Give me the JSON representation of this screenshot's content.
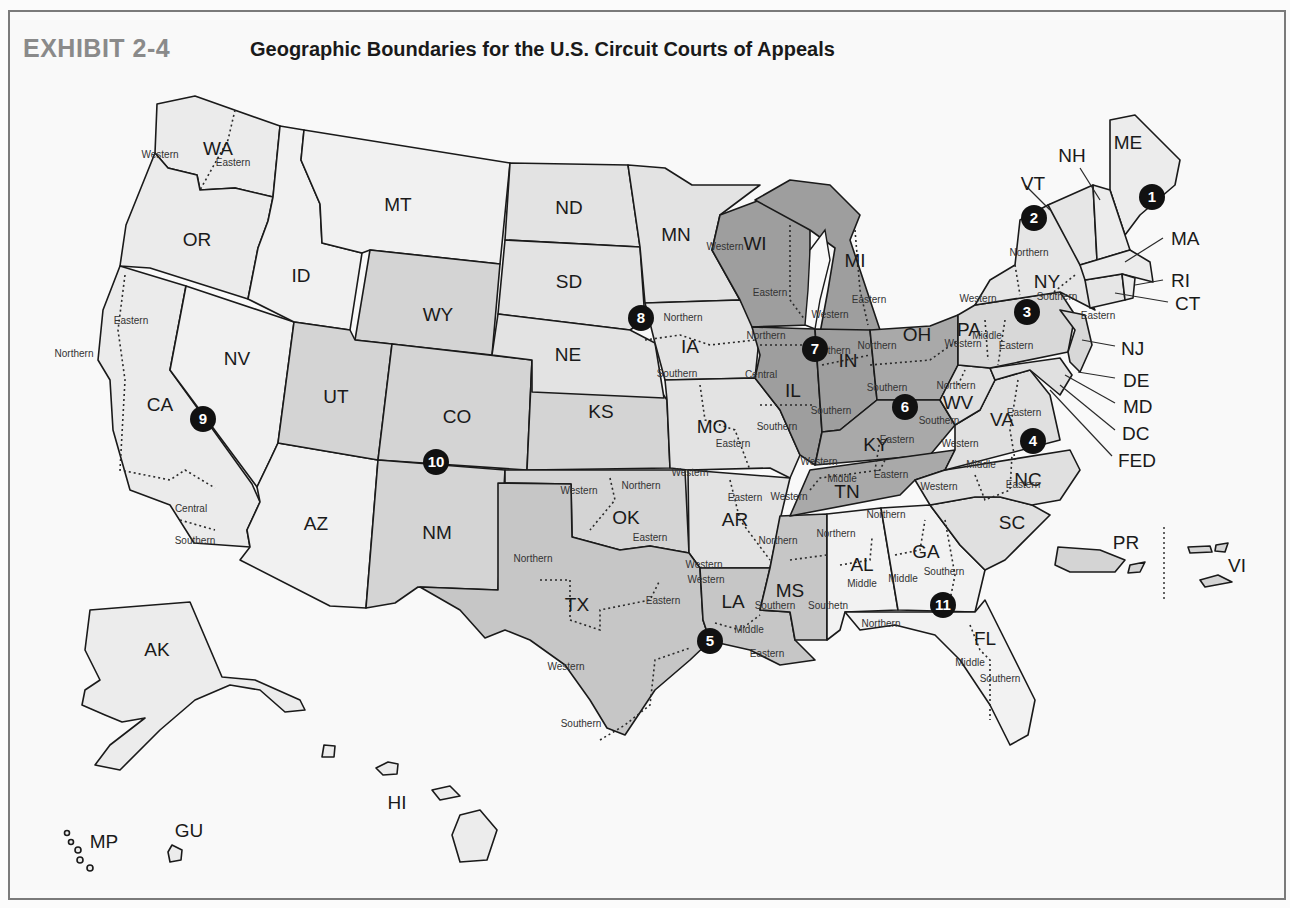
{
  "header": {
    "exhibit_label": "EXHIBIT 2-4",
    "title": "Geographic Boundaries for the U.S. Circuit Courts of Appeals"
  },
  "colors": {
    "light": "#e9e9e9",
    "medium": "#cfcfcf",
    "dark": "#9a9a9a",
    "white_region": "#f3f3f3",
    "marker": "#111111"
  },
  "states": [
    {
      "abbr": "WA",
      "x": 218,
      "y": 150
    },
    {
      "abbr": "OR",
      "x": 197,
      "y": 241
    },
    {
      "abbr": "CA",
      "x": 160,
      "y": 406
    },
    {
      "abbr": "NV",
      "x": 237,
      "y": 360
    },
    {
      "abbr": "ID",
      "x": 301,
      "y": 277
    },
    {
      "abbr": "MT",
      "x": 398,
      "y": 206
    },
    {
      "abbr": "WY",
      "x": 438,
      "y": 316
    },
    {
      "abbr": "UT",
      "x": 336,
      "y": 398
    },
    {
      "abbr": "CO",
      "x": 457,
      "y": 418
    },
    {
      "abbr": "AZ",
      "x": 316,
      "y": 525
    },
    {
      "abbr": "NM",
      "x": 437,
      "y": 534
    },
    {
      "abbr": "ND",
      "x": 569,
      "y": 209
    },
    {
      "abbr": "SD",
      "x": 569,
      "y": 283
    },
    {
      "abbr": "NE",
      "x": 568,
      "y": 356
    },
    {
      "abbr": "KS",
      "x": 601,
      "y": 413
    },
    {
      "abbr": "OK",
      "x": 626,
      "y": 519
    },
    {
      "abbr": "TX",
      "x": 577,
      "y": 606
    },
    {
      "abbr": "MN",
      "x": 676,
      "y": 236
    },
    {
      "abbr": "IA",
      "x": 690,
      "y": 348
    },
    {
      "abbr": "MO",
      "x": 712,
      "y": 428
    },
    {
      "abbr": "AR",
      "x": 735,
      "y": 521
    },
    {
      "abbr": "LA",
      "x": 733,
      "y": 603
    },
    {
      "abbr": "WI",
      "x": 755,
      "y": 245
    },
    {
      "abbr": "IL",
      "x": 793,
      "y": 392
    },
    {
      "abbr": "MI",
      "x": 855,
      "y": 262
    },
    {
      "abbr": "IN",
      "x": 848,
      "y": 362
    },
    {
      "abbr": "OH",
      "x": 917,
      "y": 336
    },
    {
      "abbr": "KY",
      "x": 876,
      "y": 446
    },
    {
      "abbr": "TN",
      "x": 847,
      "y": 493
    },
    {
      "abbr": "MS",
      "x": 790,
      "y": 592
    },
    {
      "abbr": "AL",
      "x": 862,
      "y": 566
    },
    {
      "abbr": "GA",
      "x": 926,
      "y": 553
    },
    {
      "abbr": "FL",
      "x": 985,
      "y": 640
    },
    {
      "abbr": "SC",
      "x": 1012,
      "y": 524
    },
    {
      "abbr": "NC",
      "x": 1028,
      "y": 481
    },
    {
      "abbr": "VA",
      "x": 1002,
      "y": 421
    },
    {
      "abbr": "WV",
      "x": 958,
      "y": 404
    },
    {
      "abbr": "PA",
      "x": 969,
      "y": 331
    },
    {
      "abbr": "NY",
      "x": 1047,
      "y": 283
    },
    {
      "abbr": "VT",
      "x": 1033,
      "y": 185
    },
    {
      "abbr": "NH",
      "x": 1072,
      "y": 157
    },
    {
      "abbr": "ME",
      "x": 1128,
      "y": 144
    },
    {
      "abbr": "AK",
      "x": 157,
      "y": 651
    },
    {
      "abbr": "HI",
      "x": 397,
      "y": 804
    },
    {
      "abbr": "GU",
      "x": 189,
      "y": 832
    },
    {
      "abbr": "MP",
      "x": 104,
      "y": 843
    },
    {
      "abbr": "PR",
      "x": 1126,
      "y": 544
    },
    {
      "abbr": "VI",
      "x": 1237,
      "y": 567
    }
  ],
  "callouts": [
    {
      "abbr": "MA",
      "x": 1171,
      "y": 240
    },
    {
      "abbr": "RI",
      "x": 1171,
      "y": 282
    },
    {
      "abbr": "CT",
      "x": 1175,
      "y": 305
    },
    {
      "abbr": "NJ",
      "x": 1121,
      "y": 350
    },
    {
      "abbr": "DE",
      "x": 1123,
      "y": 382
    },
    {
      "abbr": "MD",
      "x": 1123,
      "y": 408
    },
    {
      "abbr": "DC",
      "x": 1122,
      "y": 435
    },
    {
      "abbr": "FED",
      "x": 1118,
      "y": 462
    }
  ],
  "districts": [
    {
      "text": "Western",
      "x": 160,
      "y": 155
    },
    {
      "text": "Eastern",
      "x": 233,
      "y": 163
    },
    {
      "text": "Eastern",
      "x": 131,
      "y": 321
    },
    {
      "text": "Northern",
      "x": 74,
      "y": 354
    },
    {
      "text": "Central",
      "x": 191,
      "y": 509
    },
    {
      "text": "Southern",
      "x": 195,
      "y": 541
    },
    {
      "text": "Northern",
      "x": 683,
      "y": 318
    },
    {
      "text": "Southern",
      "x": 677,
      "y": 374
    },
    {
      "text": "Eastern",
      "x": 733,
      "y": 444
    },
    {
      "text": "Western",
      "x": 690,
      "y": 473
    },
    {
      "text": "Western",
      "x": 579,
      "y": 491
    },
    {
      "text": "Northern",
      "x": 641,
      "y": 486
    },
    {
      "text": "Eastern",
      "x": 650,
      "y": 538
    },
    {
      "text": "Eastern",
      "x": 745,
      "y": 498
    },
    {
      "text": "Western",
      "x": 704,
      "y": 565
    },
    {
      "text": "Northern",
      "x": 533,
      "y": 559
    },
    {
      "text": "Eastern",
      "x": 663,
      "y": 601
    },
    {
      "text": "Western",
      "x": 566,
      "y": 667
    },
    {
      "text": "Southern",
      "x": 581,
      "y": 724
    },
    {
      "text": "Western",
      "x": 706,
      "y": 580
    },
    {
      "text": "Middle",
      "x": 749,
      "y": 630
    },
    {
      "text": "Eastern",
      "x": 767,
      "y": 654
    },
    {
      "text": "Western",
      "x": 725,
      "y": 247
    },
    {
      "text": "Eastern",
      "x": 770,
      "y": 293
    },
    {
      "text": "Northern",
      "x": 766,
      "y": 336
    },
    {
      "text": "Central",
      "x": 761,
      "y": 375
    },
    {
      "text": "Southern",
      "x": 777,
      "y": 427
    },
    {
      "text": "Western",
      "x": 830,
      "y": 315
    },
    {
      "text": "Eastern",
      "x": 869,
      "y": 300
    },
    {
      "text": "Northern",
      "x": 831,
      "y": 351
    },
    {
      "text": "Southern",
      "x": 831,
      "y": 411
    },
    {
      "text": "Northern",
      "x": 877,
      "y": 346
    },
    {
      "text": "Southern",
      "x": 887,
      "y": 388
    },
    {
      "text": "Eastern",
      "x": 897,
      "y": 440
    },
    {
      "text": "Western",
      "x": 819,
      "y": 462
    },
    {
      "text": "Middle",
      "x": 842,
      "y": 479
    },
    {
      "text": "Eastern",
      "x": 891,
      "y": 475
    },
    {
      "text": "Western",
      "x": 789,
      "y": 497
    },
    {
      "text": "Northern",
      "x": 778,
      "y": 541
    },
    {
      "text": "Southern",
      "x": 775,
      "y": 606
    },
    {
      "text": "Northern",
      "x": 836,
      "y": 534
    },
    {
      "text": "Middle",
      "x": 862,
      "y": 584
    },
    {
      "text": "Southetn",
      "x": 828,
      "y": 606
    },
    {
      "text": "Northern",
      "x": 886,
      "y": 515
    },
    {
      "text": "Middle",
      "x": 903,
      "y": 579
    },
    {
      "text": "Southern",
      "x": 944,
      "y": 572
    },
    {
      "text": "Northern",
      "x": 881,
      "y": 624
    },
    {
      "text": "Middle",
      "x": 970,
      "y": 663
    },
    {
      "text": "Southern",
      "x": 1000,
      "y": 679
    },
    {
      "text": "Western",
      "x": 960,
      "y": 444
    },
    {
      "text": "Middle",
      "x": 981,
      "y": 465
    },
    {
      "text": "Western",
      "x": 939,
      "y": 487
    },
    {
      "text": "Eastern",
      "x": 1023,
      "y": 485
    },
    {
      "text": "Eastern",
      "x": 1024,
      "y": 413
    },
    {
      "text": "Northern",
      "x": 956,
      "y": 386
    },
    {
      "text": "Southern",
      "x": 939,
      "y": 421
    },
    {
      "text": "Western",
      "x": 963,
      "y": 344
    },
    {
      "text": "Middle",
      "x": 987,
      "y": 336
    },
    {
      "text": "Eastern",
      "x": 1016,
      "y": 346
    },
    {
      "text": "Northern",
      "x": 1029,
      "y": 253
    },
    {
      "text": "Western",
      "x": 978,
      "y": 299
    },
    {
      "text": "Southern",
      "x": 1057,
      "y": 297
    },
    {
      "text": "Eastern",
      "x": 1098,
      "y": 316
    }
  ],
  "circuits": [
    {
      "num": "1",
      "x": 1152,
      "y": 197
    },
    {
      "num": "2",
      "x": 1034,
      "y": 218
    },
    {
      "num": "3",
      "x": 1027,
      "y": 312
    },
    {
      "num": "4",
      "x": 1033,
      "y": 441
    },
    {
      "num": "5",
      "x": 710,
      "y": 641
    },
    {
      "num": "6",
      "x": 905,
      "y": 407
    },
    {
      "num": "7",
      "x": 815,
      "y": 349
    },
    {
      "num": "8",
      "x": 641,
      "y": 318
    },
    {
      "num": "9",
      "x": 203,
      "y": 419
    },
    {
      "num": "10",
      "x": 436,
      "y": 462
    },
    {
      "num": "11",
      "x": 943,
      "y": 605
    }
  ]
}
